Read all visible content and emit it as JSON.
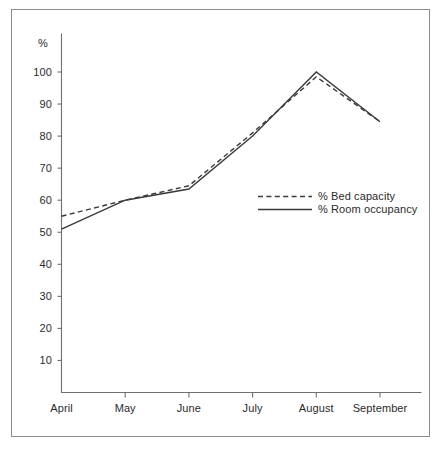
{
  "chart_data": {
    "type": "line",
    "title": "",
    "subtitle": "",
    "xlabel": "",
    "ylabel": "%",
    "categories": [
      "April",
      "May",
      "June",
      "July",
      "August",
      "September"
    ],
    "series": [
      {
        "name": "% Bed capacity",
        "style": "dashed",
        "values": [
          55,
          60,
          64.5,
          81,
          98.5,
          84.5
        ]
      },
      {
        "name": "% Room occupancy",
        "style": "solid",
        "values": [
          51,
          60,
          63.5,
          80,
          100,
          84.5
        ]
      }
    ],
    "ylim": [
      0,
      105
    ],
    "yticks": [
      10,
      20,
      30,
      40,
      50,
      60,
      70,
      80,
      90,
      100
    ],
    "ytick_labels": [
      "10",
      "20",
      "30",
      "40",
      "50",
      "60",
      "70",
      "80",
      "90",
      "100"
    ],
    "grid": false,
    "legend_position": "center-right",
    "legend_entries": [
      "% Bed capacity",
      "% Room occupancy"
    ],
    "annotations": [],
    "colors": {
      "line": "#3a3a3a",
      "axis": "#6f6f6f",
      "frame": "#8d8d8d",
      "background": "#ffffff",
      "text": "#2b2b2b"
    }
  }
}
